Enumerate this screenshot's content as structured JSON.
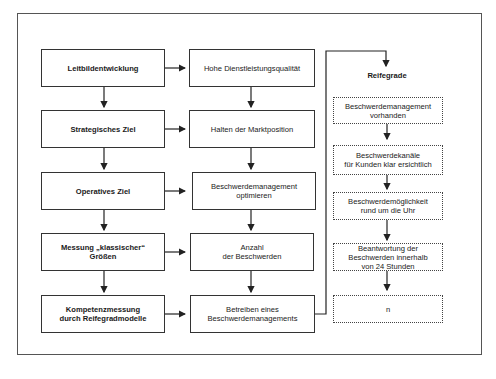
{
  "diagram": {
    "left_column": [
      {
        "id": "L1",
        "label": "Leitbildentwicklung"
      },
      {
        "id": "L2",
        "label": "Strategisches Ziel"
      },
      {
        "id": "L3",
        "label": "Operatives Ziel"
      },
      {
        "id": "L4",
        "label": "Messung „klassischer“\nGrößen"
      },
      {
        "id": "L5",
        "label": "Kompetenzmessung\ndurch Reifegradmodelle"
      }
    ],
    "middle_column": [
      {
        "id": "M1",
        "label": "Hohe Dienstleistungsqualität"
      },
      {
        "id": "M2",
        "label": "Halten der Marktposition"
      },
      {
        "id": "M3",
        "label": "Beschwerdemanagement\noptimieren"
      },
      {
        "id": "M4",
        "label": "Anzahl\nder Beschwerden"
      },
      {
        "id": "M5",
        "label": "Betreiben eines\nBeschwerdemanagements"
      }
    ],
    "right_column": {
      "title": "Reifegrade",
      "levels": [
        {
          "id": "R1",
          "label": "Beschwerdemanagement\nvorhanden"
        },
        {
          "id": "R2",
          "label": "Beschwerdekanäle\nfür Kunden klar ersichtlich"
        },
        {
          "id": "R3",
          "label": "Beschwerdemöglichkeit\nrund um die Uhr"
        },
        {
          "id": "R4",
          "label": "Beantwortung der\nBeschwerden innerhalb\nvon 24 Stunden"
        },
        {
          "id": "R5",
          "label": "n"
        }
      ]
    },
    "edges": [
      [
        "L1",
        "L2"
      ],
      [
        "L2",
        "L3"
      ],
      [
        "L3",
        "L4"
      ],
      [
        "L4",
        "L5"
      ],
      [
        "L1",
        "M1"
      ],
      [
        "L2",
        "M2"
      ],
      [
        "L3",
        "M3"
      ],
      [
        "L4",
        "M4"
      ],
      [
        "L5",
        "M5"
      ],
      [
        "M1",
        "M2"
      ],
      [
        "M2",
        "M3"
      ],
      [
        "M3",
        "M4"
      ],
      [
        "M4",
        "M5"
      ],
      [
        "M5",
        "Reifegrade"
      ],
      [
        "R1",
        "R2"
      ],
      [
        "R2",
        "R3"
      ],
      [
        "R3",
        "R4"
      ],
      [
        "R4",
        "R5"
      ]
    ]
  }
}
